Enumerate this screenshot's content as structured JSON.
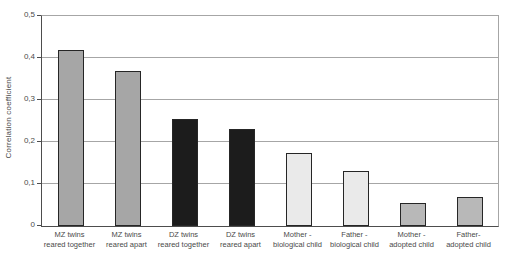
{
  "chart_data": {
    "type": "bar",
    "title": "",
    "xlabel": "",
    "ylabel": "Correlation coefficient",
    "ylim": [
      0,
      0.5
    ],
    "grid": true,
    "legend": false,
    "decimal_separator": ",",
    "yticks": [
      {
        "value": 0.5,
        "label": "0,5"
      },
      {
        "value": 0.4,
        "label": "0,4"
      },
      {
        "value": 0.3,
        "label": "0,3"
      },
      {
        "value": 0.2,
        "label": "0,2"
      },
      {
        "value": 0.1,
        "label": "0,1"
      },
      {
        "value": 0.0,
        "label": "0"
      }
    ],
    "categories": [
      {
        "line1": "MZ twins",
        "line2": "reared together"
      },
      {
        "line1": "MZ twins",
        "line2": "reared apart"
      },
      {
        "line1": "DZ twins",
        "line2": "reared together"
      },
      {
        "line1": "DZ twins",
        "line2": "reared apart"
      },
      {
        "line1": "Mother -",
        "line2": "biological child"
      },
      {
        "line1": "Father -",
        "line2": "biological child"
      },
      {
        "line1": "Mother -",
        "line2": "adopted child"
      },
      {
        "line1": "Father-",
        "line2": "adopted child"
      }
    ],
    "values": [
      0.42,
      0.37,
      0.255,
      0.23,
      0.175,
      0.13,
      0.055,
      0.07
    ],
    "bar_colors": [
      "#a6a6a6",
      "#a6a6a6",
      "#1c1c1c",
      "#1c1c1c",
      "#eaeaea",
      "#eaeaea",
      "#b8b8b8",
      "#b8b8b8"
    ],
    "bar_border_color": "#262626",
    "gridline_color": "#a6a6a6",
    "axis_color": "#4d4d4d"
  }
}
